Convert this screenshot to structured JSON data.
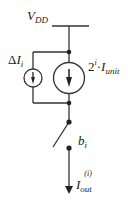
{
  "diagram": {
    "type": "circuit-schematic",
    "supply_label": {
      "main": "V",
      "sub": "DD"
    },
    "delta_source_label": {
      "prefix": "Δ",
      "main": "I",
      "sub": "i"
    },
    "main_source_label": {
      "base": "2",
      "exp": "i",
      "dot": "·",
      "main": "I",
      "sub": "unit"
    },
    "switch_label": {
      "main": "b",
      "sub": "i"
    },
    "output_label": {
      "main": "I",
      "sub": "out",
      "sup": "(i)"
    },
    "colors": {
      "wire": "#333333",
      "text": "#222222"
    }
  }
}
